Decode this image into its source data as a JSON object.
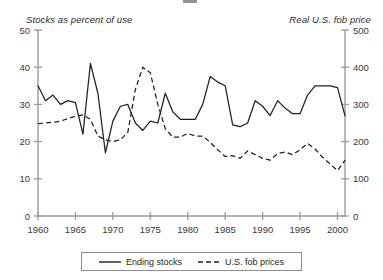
{
  "axis_captions": {
    "left": "Stocks as percent of use",
    "right": "Real U.S. fob price"
  },
  "legend": {
    "series1_label": "Ending stocks",
    "series2_label": "U.S. fob prices"
  },
  "colors": {
    "line": "#231f20",
    "axis": "#9a9a9a",
    "text": "#231f20",
    "background": "#ffffff"
  },
  "axes": {
    "left_ticks": [
      "0",
      "10",
      "20",
      "30",
      "40",
      "50"
    ],
    "right_ticks": [
      "0",
      "100",
      "200",
      "300",
      "400",
      "500"
    ],
    "x_ticks": [
      "1960",
      "1965",
      "1970",
      "1975",
      "1980",
      "1985",
      "1990",
      "1995",
      "2000"
    ]
  },
  "chart_data": {
    "type": "line",
    "title": "",
    "subtitle": "",
    "xlabel": "",
    "ylabel": "Stocks as percent of use",
    "y2label": "Real U.S. fob price",
    "xlim": [
      1960,
      2001
    ],
    "ylim": [
      0,
      50
    ],
    "y2lim": [
      0,
      500
    ],
    "yticks": [
      0,
      10,
      20,
      30,
      40,
      50
    ],
    "y2ticks": [
      0,
      100,
      200,
      300,
      400,
      500
    ],
    "xticks": [
      1960,
      1965,
      1970,
      1975,
      1980,
      1985,
      1990,
      1995,
      2000
    ],
    "grid": false,
    "legend_position": "bottom",
    "x": [
      1960,
      1961,
      1962,
      1963,
      1964,
      1965,
      1966,
      1967,
      1968,
      1969,
      1970,
      1971,
      1972,
      1973,
      1974,
      1975,
      1976,
      1977,
      1978,
      1979,
      1980,
      1981,
      1982,
      1983,
      1984,
      1985,
      1986,
      1987,
      1988,
      1989,
      1990,
      1991,
      1992,
      1993,
      1994,
      1995,
      1996,
      1997,
      1998,
      1999,
      2000,
      2001
    ],
    "series": [
      {
        "name": "Ending stocks",
        "axis": "left",
        "style": "solid",
        "unit": "percent of use",
        "values": [
          35.0,
          31.0,
          32.5,
          30.0,
          31.0,
          30.5,
          22.0,
          41.0,
          33.0,
          17.0,
          25.5,
          29.5,
          30.0,
          25.0,
          23.0,
          25.5,
          25.0,
          33.0,
          28.0,
          26.0,
          26.0,
          26.0,
          30.0,
          37.5,
          36.0,
          35.0,
          24.5,
          24.0,
          25.0,
          31.0,
          29.5,
          27.0,
          31.0,
          29.0,
          27.5,
          27.5,
          32.5,
          35.0,
          35.0,
          35.0,
          34.5,
          27.0
        ]
      },
      {
        "name": "U.S. fob prices",
        "axis": "right",
        "style": "dashed",
        "unit": "real dollars per ton",
        "values": [
          248,
          250,
          252,
          255,
          262,
          268,
          272,
          260,
          215,
          205,
          200,
          205,
          225,
          340,
          400,
          385,
          300,
          235,
          212,
          212,
          222,
          215,
          215,
          198,
          178,
          160,
          162,
          155,
          175,
          165,
          155,
          150,
          168,
          172,
          165,
          178,
          195,
          180,
          158,
          140,
          122,
          150
        ]
      }
    ]
  }
}
